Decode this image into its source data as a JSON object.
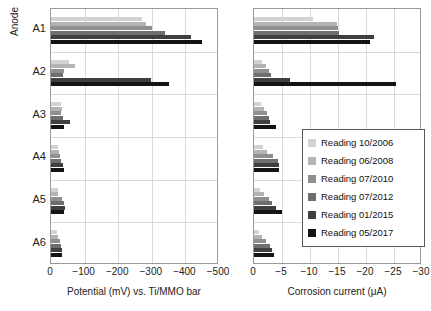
{
  "chart_data": [
    {
      "id": "potential",
      "type": "bar",
      "orientation": "horizontal",
      "title": "",
      "xlabel": "Potential (mV) vs. Ti/MMO bar",
      "ylabel": "Anode",
      "categories": [
        "A1",
        "A2",
        "A3",
        "A4",
        "A5",
        "A6"
      ],
      "xticks": [
        0,
        -100,
        -200,
        -300,
        -400,
        -500
      ],
      "xticklabels": [
        "0",
        "−100",
        "−200",
        "−300",
        "−400",
        "−500"
      ],
      "xlim": [
        0,
        -500
      ],
      "grid": true,
      "legend_position": "right-chart-inside",
      "series": [
        {
          "name": "Reading 10/2006",
          "color": "#d2d2d2",
          "values": [
            -270,
            -55,
            -30,
            -22,
            -20,
            -18
          ]
        },
        {
          "name": "Reading 06/2008",
          "color": "#b4b4b4",
          "values": [
            -282,
            -70,
            -32,
            -25,
            -22,
            -20
          ]
        },
        {
          "name": "Reading 07/2010",
          "color": "#8f8f8f",
          "values": [
            -300,
            -38,
            -30,
            -28,
            -32,
            -26
          ]
        },
        {
          "name": "Reading 07/2012",
          "color": "#6e6e6e",
          "values": [
            -338,
            -35,
            -35,
            -30,
            -40,
            -30
          ]
        },
        {
          "name": "Reading 01/2015",
          "color": "#3f3f3f",
          "values": [
            -418,
            -298,
            -58,
            -36,
            -42,
            -34
          ]
        },
        {
          "name": "Reading 05/2017",
          "color": "#141414",
          "values": [
            -448,
            -352,
            -38,
            -38,
            -40,
            -32
          ]
        }
      ]
    },
    {
      "id": "corrosion-current",
      "type": "bar",
      "orientation": "horizontal",
      "title": "",
      "xlabel": "Corrosion current (μA)",
      "ylabel": "Anode",
      "categories": [
        "A1",
        "A2",
        "A3",
        "A4",
        "A5",
        "A6"
      ],
      "xticks": [
        0,
        -5,
        -10,
        -15,
        -20,
        -25,
        -30
      ],
      "xticklabels": [
        "0",
        "−5",
        "−10",
        "−15",
        "−20",
        "−25",
        "−30"
      ],
      "xlim": [
        0,
        -30
      ],
      "grid": true,
      "legend_position": "inside-right",
      "series": [
        {
          "name": "Reading 10/2006",
          "color": "#d2d2d2",
          "values": [
            -10.6,
            -1.4,
            -1.2,
            -1.6,
            -1.1,
            -0.9
          ]
        },
        {
          "name": "Reading 06/2008",
          "color": "#b4b4b4",
          "values": [
            -14.8,
            -2.1,
            -1.8,
            -2.4,
            -1.7,
            -1.5
          ]
        },
        {
          "name": "Reading 07/2010",
          "color": "#8f8f8f",
          "values": [
            -15.0,
            -2.6,
            -2.3,
            -3.4,
            -2.6,
            -2.2
          ]
        },
        {
          "name": "Reading 07/2012",
          "color": "#6e6e6e",
          "values": [
            -15.1,
            -3.0,
            -2.6,
            -4.2,
            -3.2,
            -2.8
          ]
        },
        {
          "name": "Reading 01/2015",
          "color": "#3f3f3f",
          "values": [
            -21.5,
            -6.4,
            -2.8,
            -4.5,
            -4.0,
            -3.2
          ]
        },
        {
          "name": "Reading 05/2017",
          "color": "#141414",
          "values": [
            -20.8,
            -25.4,
            -4.0,
            -4.4,
            -5.0,
            -3.6
          ]
        }
      ]
    }
  ],
  "axes": {
    "y_title": "Anode",
    "categories": [
      "A1",
      "A2",
      "A3",
      "A4",
      "A5",
      "A6"
    ],
    "left": {
      "x_title": "Potential (mV) vs. Ti/MMO bar",
      "x_ticklabels": [
        "0",
        "−100",
        "−200",
        "−300",
        "−400",
        "−500"
      ]
    },
    "right": {
      "x_title": "Corrosion current (μA)",
      "x_ticklabels": [
        "0",
        "−5",
        "−10",
        "−15",
        "−20",
        "−25",
        "−30"
      ]
    }
  },
  "legend": {
    "items": [
      {
        "label": "Reading 10/2006",
        "color": "#d2d2d2"
      },
      {
        "label": "Reading 06/2008",
        "color": "#b4b4b4"
      },
      {
        "label": "Reading 07/2010",
        "color": "#8f8f8f"
      },
      {
        "label": "Reading 07/2012",
        "color": "#6e6e6e"
      },
      {
        "label": "Reading 01/2015",
        "color": "#3f3f3f"
      },
      {
        "label": "Reading 05/2017",
        "color": "#141414"
      }
    ]
  }
}
